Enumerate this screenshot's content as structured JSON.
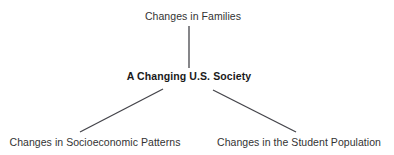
{
  "diagram": {
    "type": "hierarchy-tree",
    "background_color": "#ffffff",
    "line_color": "#44444a",
    "text_color": "#333333",
    "root_text_color": "#1a1a1a",
    "root": {
      "label": "A Changing U.S. Society",
      "emphasis": "bold"
    },
    "nodes": [
      {
        "id": "top",
        "label": "Changes in Families",
        "position": "above-center"
      },
      {
        "id": "center",
        "label": "A Changing U.S. Society",
        "position": "center"
      },
      {
        "id": "bottom-left",
        "label": "Changes in Socioeconomic Patterns",
        "position": "below-left"
      },
      {
        "id": "bottom-right",
        "label": "Changes in the Student Population",
        "position": "below-right"
      }
    ],
    "connectors": [
      {
        "id": "center-to-top",
        "from": "center",
        "to": "top",
        "x1": 189,
        "y1": 68,
        "x2": 189,
        "y2": 26
      },
      {
        "id": "center-to-bottom-left",
        "from": "center",
        "to": "bottom-left",
        "x1": 163,
        "y1": 89,
        "x2": 80,
        "y2": 132
      },
      {
        "id": "center-to-bottom-right",
        "from": "center",
        "to": "bottom-right",
        "x1": 213,
        "y1": 90,
        "x2": 296,
        "y2": 132
      }
    ]
  }
}
